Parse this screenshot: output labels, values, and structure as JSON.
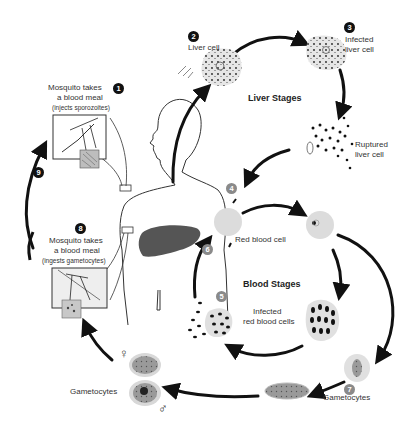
{
  "diagram": {
    "stages": {
      "liver": "Liver Stages",
      "blood": "Blood Stages"
    },
    "steps": [
      {
        "number": "1",
        "label_line1": "Mosquito takes",
        "label_line2": "a blood meal",
        "label_note": "(injects sporozoites)"
      },
      {
        "number": "2",
        "label": "Liver cell"
      },
      {
        "number": "3",
        "label_line1": "Infected",
        "label_line2": "liver cell"
      },
      {
        "number": "",
        "label_line1": "Ruptured",
        "label_line2": "liver cell"
      },
      {
        "number": "4",
        "label": "Red blood cell"
      },
      {
        "number": "5",
        "label_line1": "Infected",
        "label_line2": "red blood cells"
      },
      {
        "number": "6",
        "label": ""
      },
      {
        "number": "7",
        "label": "Gametocytes"
      },
      {
        "number": "8",
        "label_line1": "Mosquito takes",
        "label_line2": "a blood meal",
        "label_note": "(ingests gametocytes)"
      },
      {
        "number": "9",
        "label": ""
      }
    ],
    "gametocytes_left_label": "Gametocytes",
    "female_symbol": "♀",
    "male_symbol": "♂",
    "colors": {
      "arrow": "#111111",
      "cell_fill": "#e4e4e4",
      "liver_organ": "#555555",
      "badge_dark": "#111111",
      "badge_grey": "#8a8a8a"
    }
  }
}
